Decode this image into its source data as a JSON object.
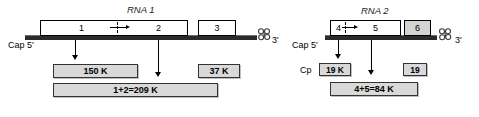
{
  "figure": {
    "title_hidden": "",
    "background": "#ffffff",
    "line_color": "#2b2b2b",
    "box_fill": "#d9d9d9",
    "orf_fill": "#ffffff",
    "orf_shaded_fill": "#d4d4d4"
  },
  "rna1": {
    "name": "RNA 1",
    "cap_label": "Cap 5'",
    "three_prime_label": "3'",
    "orfs": [
      {
        "id": "orf-1",
        "label": "1"
      },
      {
        "id": "orf-2",
        "label": "2"
      },
      {
        "id": "orf-3",
        "label": "3"
      }
    ],
    "products": [
      {
        "id": "product-150k",
        "label": "150 K"
      },
      {
        "id": "product-readthrough-209k",
        "label": "1+2=209 K"
      },
      {
        "id": "product-37k",
        "label": "37 K"
      }
    ]
  },
  "rna2": {
    "name": "RNA 2",
    "cap_label": "Cap 5'",
    "three_prime_label": "3'",
    "orfs": [
      {
        "id": "orf-4",
        "label": "4"
      },
      {
        "id": "orf-5",
        "label": "5"
      },
      {
        "id": "orf-6",
        "label": "6"
      }
    ],
    "cp_label": "Cp",
    "products": [
      {
        "id": "product-19k",
        "label": "19 K"
      },
      {
        "id": "product-readthrough-84k",
        "label": "4+5=84 K"
      },
      {
        "id": "product-19",
        "label": "19"
      }
    ]
  },
  "icons": {
    "trna_clover": "trna-clover-icon",
    "down_arrow": "down-arrow-icon",
    "right_arrow": "right-arrow-icon"
  }
}
